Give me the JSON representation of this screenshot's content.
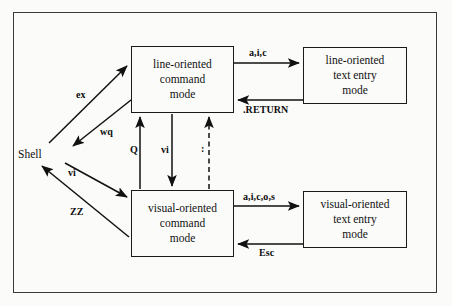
{
  "figure": {
    "kind": "state-transition-diagram",
    "border_color": "#3a3a3a",
    "line_color": "#1a1a1a",
    "background": "#fbfbfa"
  },
  "nodes": {
    "shell": {
      "label": "Shell",
      "shape": "text"
    },
    "line_command": {
      "lines": [
        "line-oriented",
        "command",
        "mode"
      ],
      "shape": "box"
    },
    "line_text_entry": {
      "lines": [
        "line-oriented",
        "text  entry",
        "mode"
      ],
      "shape": "box"
    },
    "visual_command": {
      "lines": [
        "visual-oriented",
        "command",
        "mode"
      ],
      "shape": "box"
    },
    "visual_text_entry": {
      "lines": [
        "visual-oriented",
        "text  entry",
        "mode"
      ],
      "shape": "box"
    }
  },
  "edges": {
    "shell_to_line_command": {
      "label": "ex",
      "style": "solid"
    },
    "line_command_to_shell": {
      "label": "wq",
      "style": "solid"
    },
    "shell_to_visual_command": {
      "label": "vi",
      "style": "solid"
    },
    "visual_command_to_shell": {
      "label": "ZZ",
      "style": "solid"
    },
    "visual_to_line_command": {
      "label": "Q",
      "style": "solid"
    },
    "line_to_visual_command": {
      "label": "vi",
      "style": "solid"
    },
    "visual_to_line_colon": {
      "label": ":",
      "style": "dashed"
    },
    "line_command_to_text_entry": {
      "label": "a,i,c",
      "style": "solid"
    },
    "line_text_entry_to_command": {
      "label": ".RETURN",
      "style": "solid"
    },
    "visual_command_to_text_entry": {
      "label": "a,i,c,o,s",
      "style": "solid"
    },
    "visual_text_entry_to_command": {
      "label": "Esc",
      "style": "solid"
    }
  }
}
